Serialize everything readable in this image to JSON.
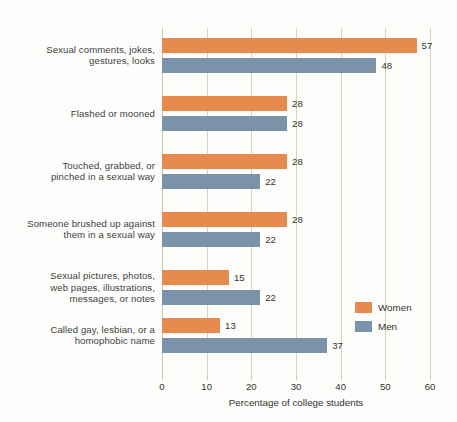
{
  "chart_data": {
    "type": "bar",
    "orientation": "horizontal",
    "title": "",
    "xlabel": "Percentage of college students",
    "ylabel": "",
    "xlim": [
      0,
      60
    ],
    "xticks": [
      0,
      10,
      20,
      30,
      40,
      50,
      60
    ],
    "grid": true,
    "legend_position": "right-inside",
    "categories": [
      "Sexual comments, jokes, gestures, looks",
      "Flashed or mooned",
      "Touched, grabbed, or pinched in a sexual way",
      "Someone brushed up against them in a sexual way",
      "Sexual pictures, photos, web pages, illustrations, messages, or notes",
      "Called gay, lesbian, or a homophobic name"
    ],
    "category_lines": [
      [
        "Sexual comments, jokes,",
        "gestures, looks"
      ],
      [
        "Flashed or mooned"
      ],
      [
        "Touched, grabbed, or",
        "pinched in a sexual way"
      ],
      [
        "Someone brushed up against",
        "them in a sexual way"
      ],
      [
        "Sexual pictures, photos,",
        "web pages, illustrations,",
        "messages, or notes"
      ],
      [
        "Called gay, lesbian, or a",
        "homophobic name"
      ]
    ],
    "series": [
      {
        "name": "Women",
        "color": "#e68a4e",
        "values": [
          57,
          28,
          28,
          28,
          15,
          13
        ]
      },
      {
        "name": "Men",
        "color": "#7a93a8",
        "values": [
          48,
          28,
          22,
          22,
          22,
          37
        ]
      }
    ]
  },
  "legend": {
    "items": [
      {
        "label": "Women",
        "color": "#e68a4e"
      },
      {
        "label": "Men",
        "color": "#7a93a8"
      }
    ]
  },
  "axis": {
    "title": "Percentage of college students",
    "tick_labels": [
      "0",
      "10",
      "20",
      "30",
      "40",
      "50",
      "60"
    ]
  },
  "colors": {
    "women": "#e68a4e",
    "men": "#7a93a8",
    "gridline": "#d8d2b8",
    "text": "#33322f",
    "background": "#fdfdfb"
  }
}
